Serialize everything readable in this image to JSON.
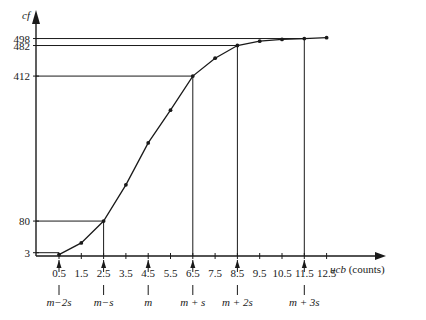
{
  "chart_data": {
    "type": "line",
    "title": "",
    "xlabel": "ucb (counts)",
    "ylabel": "cf",
    "x": [
      0.5,
      1.5,
      2.5,
      3.5,
      4.5,
      5.5,
      6.5,
      7.5,
      8.5,
      9.5,
      10.5,
      11.5,
      12.5
    ],
    "values": [
      3,
      30,
      80,
      163,
      259,
      334,
      412,
      453,
      482,
      492,
      496,
      498,
      500
    ],
    "x_tick_labels": [
      "0.5",
      "1.5",
      "2.5",
      "3.5",
      "4.5",
      "5.5",
      "6.5",
      "7.5",
      "8.5",
      "9.5",
      "10.5",
      "11.5",
      "12.5"
    ],
    "y_tick_labels": [
      "3",
      "80",
      "412",
      "482",
      "498"
    ],
    "annotations": [
      {
        "x": 0.5,
        "label": "m−2s"
      },
      {
        "x": 2.5,
        "label": "m−s"
      },
      {
        "x": 4.5,
        "label": "m"
      },
      {
        "x": 6.5,
        "label": "m + s"
      },
      {
        "x": 8.5,
        "label": "m + 2s"
      },
      {
        "x": 11.5,
        "label": "m + 3s"
      }
    ],
    "reference_lines": [
      {
        "y": 3,
        "x": 0.5
      },
      {
        "y": 80,
        "x": 2.5
      },
      {
        "y": 412,
        "x": 6.5
      },
      {
        "y": 482,
        "x": 8.5
      },
      {
        "y": 498,
        "x": 11.5
      }
    ],
    "ylim": [
      0,
      500
    ],
    "xlim": [
      0,
      13
    ],
    "grid": false,
    "legend": "none"
  },
  "axes": {
    "y_label": "cf",
    "x_label": "ucb (counts)"
  }
}
